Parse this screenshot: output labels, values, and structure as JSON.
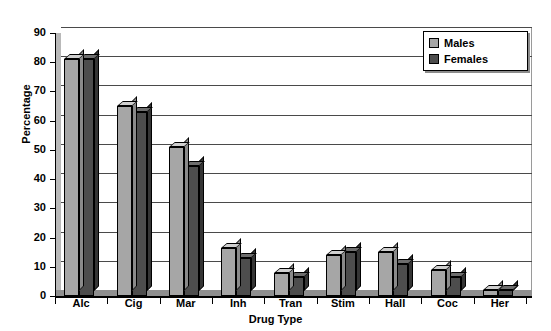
{
  "chart_data": {
    "type": "bar",
    "title": "",
    "xlabel": "Drug Type",
    "ylabel": "Percentage",
    "categories": [
      "Alc",
      "Cig",
      "Mar",
      "Inh",
      "Tran",
      "Stim",
      "Hall",
      "Coc",
      "Her"
    ],
    "series": [
      {
        "name": "Males",
        "values": [
          81,
          65,
          51,
          16.5,
          8,
          14,
          15,
          9,
          2
        ]
      },
      {
        "name": "Females",
        "values": [
          81,
          63,
          44.5,
          13,
          6.5,
          15,
          11,
          6.5,
          2
        ]
      }
    ],
    "ylim": [
      0,
      90
    ],
    "ytick_step": 10,
    "yticks": [
      "0",
      "10",
      "20",
      "30",
      "40",
      "50",
      "60",
      "70",
      "80",
      "90"
    ],
    "grid": true,
    "legend_position": "top-right",
    "colors": {
      "males": "#a6a6a6",
      "females": "#4d4d4d",
      "gridline": "#4a4a4a",
      "axis": "#000000",
      "background": "#ffffff"
    }
  },
  "legend": {
    "entries": [
      {
        "label": "Males",
        "swatch": "males"
      },
      {
        "label": "Females",
        "swatch": "females"
      }
    ]
  }
}
